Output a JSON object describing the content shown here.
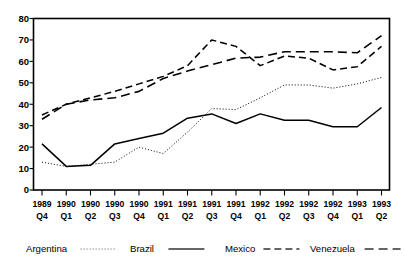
{
  "chart_data": {
    "type": "line",
    "title": "",
    "xlabel": "",
    "ylabel": "",
    "ylim": [
      0,
      80
    ],
    "ytick_step": 10,
    "grid": false,
    "legend_position": "bottom",
    "categories": [
      "1989 Q4",
      "1990 Q1",
      "1990 Q2",
      "1990 Q3",
      "1990 Q4",
      "1991 Q1",
      "1991 Q2",
      "1991 Q3",
      "1991 Q4",
      "1992 Q1",
      "1992 Q2",
      "1992 Q3",
      "1992 Q4",
      "1993 Q1",
      "1993 Q2"
    ],
    "category_years": [
      "1989",
      "1990",
      "1990",
      "1990",
      "1990",
      "1991",
      "1991",
      "1991",
      "1991",
      "1992",
      "1992",
      "1992",
      "1992",
      "1993",
      "1993"
    ],
    "category_quarters": [
      "Q4",
      "Q1",
      "Q2",
      "Q3",
      "Q4",
      "Q1",
      "Q2",
      "Q3",
      "Q4",
      "Q1",
      "Q2",
      "Q3",
      "Q4",
      "Q1",
      "Q2"
    ],
    "ytick_labels": [
      "0",
      "10",
      "20",
      "30",
      "40",
      "50",
      "60",
      "70",
      "80"
    ],
    "ytick_values": [
      0,
      10,
      20,
      30,
      40,
      50,
      60,
      70,
      80
    ],
    "series": [
      {
        "name": "Argentina",
        "style": "dotted",
        "dasharray": "1,2",
        "width": 1.0,
        "color": "#555555",
        "values": [
          13,
          11,
          12,
          13,
          20,
          17,
          27,
          38,
          37.5,
          43,
          49,
          49,
          47.5,
          49.5,
          52.5
        ]
      },
      {
        "name": "Brazil",
        "style": "solid",
        "dasharray": "",
        "width": 1.5,
        "color": "#333333",
        "values": [
          21.5,
          11,
          11.5,
          21.5,
          24,
          26.5,
          33.5,
          35.5,
          31,
          35.5,
          32.5,
          32.5,
          29.5,
          29.5,
          38.5
        ]
      },
      {
        "name": "Mexico",
        "style": "dashed",
        "dasharray": "7,4",
        "width": 1.5,
        "color": "#333333",
        "values": [
          35,
          40,
          43,
          46,
          49.5,
          53,
          58,
          70,
          67,
          58,
          62.5,
          61.5,
          56,
          57.5,
          67
        ]
      },
      {
        "name": "Venezuela",
        "style": "long-dash",
        "dasharray": "9,5",
        "width": 1.6,
        "color": "#333333",
        "values": [
          33,
          40,
          42,
          43,
          46,
          52,
          55.5,
          58.5,
          61.5,
          62,
          64.5,
          64.5,
          64.5,
          64,
          72
        ]
      }
    ]
  },
  "legend": {
    "items": [
      {
        "label": "Argentina",
        "sample": "dotted"
      },
      {
        "label": "Brazil",
        "sample": "solid"
      },
      {
        "label": "Mexico",
        "sample": "dashed"
      },
      {
        "label": "Venezuela",
        "sample": "long-dash"
      }
    ]
  }
}
